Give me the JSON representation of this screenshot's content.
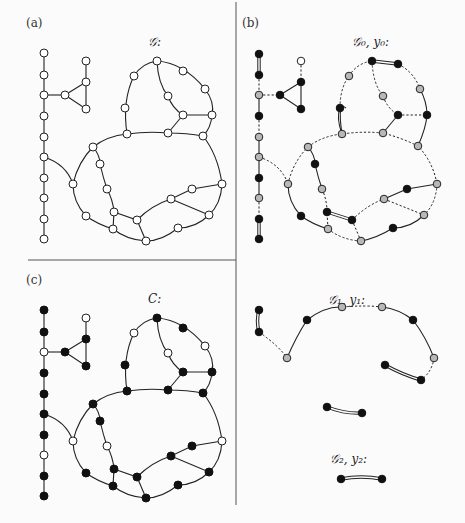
{
  "figure": {
    "panels": [
      {
        "id": "a",
        "label": "(a)",
        "title": "𝒢:"
      },
      {
        "id": "b",
        "label": "(b)",
        "title": "𝒢₀, y₀:"
      },
      {
        "id": "c",
        "label": "(c)",
        "title": "C:"
      },
      {
        "id": "d",
        "label": "",
        "title_1": "𝒢₁, y₁:",
        "title_2": "𝒢₂, y₂:"
      }
    ],
    "legend": {
      "node_white": "unselected vertex",
      "node_black": "vertex in C / y = 1",
      "node_gray": "vertex with fractional value",
      "edge_solid": "edge",
      "edge_dashed": "removed / non-tight edge",
      "edge_double": "matched edge"
    },
    "colors": {
      "black": "#111111",
      "gray": "#b8b8b8",
      "white": "#ffffff",
      "line": "#222222"
    }
  }
}
